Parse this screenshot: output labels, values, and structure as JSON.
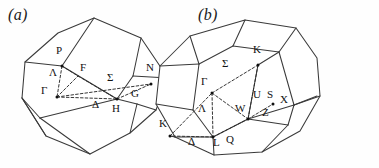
{
  "figure": {
    "background_color": "#fefefe",
    "line_color": "#3a3a3a",
    "dash_color": "#2a2a2a",
    "label_color": "#121212",
    "width": 379,
    "height": 168
  },
  "panels": [
    {
      "id": "a",
      "caption": "(a)",
      "lattice": "bcc",
      "shape": "truncated octahedron",
      "labels": [
        {
          "text": "P",
          "x": 56,
          "y": 52,
          "dot": true,
          "dot_x": 62,
          "dot_y": 66
        },
        {
          "text": "Λ",
          "x": 49,
          "y": 74,
          "dot": false
        },
        {
          "text": "Γ",
          "x": 41,
          "y": 92,
          "dot": true,
          "dot_x": 57,
          "dot_y": 97
        },
        {
          "text": "F",
          "x": 80,
          "y": 69,
          "dot": false
        },
        {
          "text": "Σ",
          "x": 107,
          "y": 79,
          "dot": false
        },
        {
          "text": "N",
          "x": 146,
          "y": 69,
          "dot": true,
          "dot_x": 151,
          "dot_y": 84
        },
        {
          "text": "Δ",
          "x": 92,
          "y": 106,
          "dot": false
        },
        {
          "text": "H",
          "x": 112,
          "y": 110,
          "dot": true,
          "dot_x": 117,
          "dot_y": 99
        },
        {
          "text": "G",
          "x": 131,
          "y": 95,
          "dot": false
        }
      ],
      "outline_points": "94,18 141,38 168,78 156,110 130,133 90,154 46,136 22,98 25,62 58,33",
      "dashed_paths": [
        "62,66 57,97",
        "57,97 78,76",
        "57,97 117,99",
        "57,97 151,84",
        "117,99 151,84",
        "78,76 117,99",
        "62,66 78,76"
      ]
    },
    {
      "id": "b",
      "caption": "(b)",
      "lattice": "fcc",
      "shape": "truncated octahedron",
      "labels": [
        {
          "text": "K",
          "x": 253,
          "y": 51,
          "dot": true,
          "dot_x": 258,
          "dot_y": 65
        },
        {
          "text": "Σ",
          "x": 222,
          "y": 65,
          "dot": false
        },
        {
          "text": "Γ",
          "x": 201,
          "y": 83,
          "dot": true,
          "dot_x": 212,
          "dot_y": 93
        },
        {
          "text": "U",
          "x": 253,
          "y": 96,
          "dot": false
        },
        {
          "text": "S",
          "x": 267,
          "y": 96,
          "dot": true,
          "dot_x": 273,
          "dot_y": 104
        },
        {
          "text": "X",
          "x": 280,
          "y": 101,
          "dot": false
        },
        {
          "text": "Λ",
          "x": 198,
          "y": 110,
          "dot": false
        },
        {
          "text": "W",
          "x": 238,
          "y": 110,
          "dot": true,
          "dot_x": 248,
          "dot_y": 119
        },
        {
          "text": "Z",
          "x": 262,
          "y": 114,
          "dot": false
        },
        {
          "text": "K",
          "x": 159,
          "y": 125,
          "dot": true,
          "dot_x": 170,
          "dot_y": 136
        },
        {
          "text": "Δ",
          "x": 188,
          "y": 143,
          "dot": false
        },
        {
          "text": "L",
          "x": 213,
          "y": 144,
          "dot": true,
          "dot_x": 213,
          "dot_y": 137
        },
        {
          "text": "Q",
          "x": 226,
          "y": 141,
          "dot": false
        }
      ],
      "outline_points": "245,20 296,28 317,58 320,96 300,131 262,152 214,155 175,137 156,104 160,66 190,36",
      "dashed_paths": [
        "212,93 258,65",
        "212,93 213,137",
        "212,93 248,119",
        "213,137 170,136",
        "213,137 248,119",
        "258,65 248,119",
        "248,119 273,104",
        "170,136 212,93"
      ]
    }
  ]
}
